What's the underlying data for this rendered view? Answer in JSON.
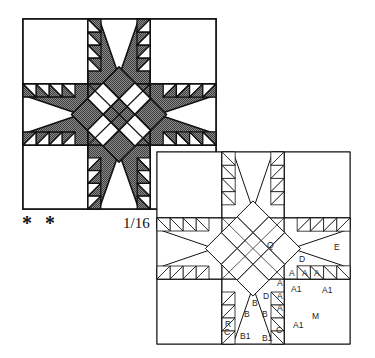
{
  "figure": {
    "rating": "* *",
    "scale_label": "1/16"
  },
  "colors": {
    "background": "#ffffff",
    "line": "#111111",
    "fabric_dark": "#6e6e6e",
    "fabric_light": "#ffffff"
  },
  "colored_block": {
    "name": "Feathered star block (shaded)",
    "grid_x": [
      23,
      88,
      150,
      216
    ],
    "grid_y": [
      19,
      84,
      145,
      209
    ],
    "feathers_per_side": 4
  },
  "pattern_block": {
    "name": "Feathered star block (piece diagram)",
    "grid_x": [
      157,
      222,
      284,
      350
    ],
    "grid_y": [
      152,
      218,
      279,
      344
    ],
    "feathers_per_side": 4,
    "piece_labels": [
      {
        "text": "Q",
        "x": 267,
        "y": 248
      },
      {
        "text": "E",
        "x": 334,
        "y": 250
      },
      {
        "text": "D",
        "x": 299,
        "y": 262
      },
      {
        "text": "A",
        "x": 289,
        "y": 276
      },
      {
        "text": "A",
        "x": 302,
        "y": 276
      },
      {
        "text": "A",
        "x": 314,
        "y": 276
      },
      {
        "text": "A1",
        "x": 291,
        "y": 292
      },
      {
        "text": "A1",
        "x": 322,
        "y": 293
      },
      {
        "text": "D",
        "x": 263,
        "y": 299
      },
      {
        "text": "A",
        "x": 277,
        "y": 286
      },
      {
        "text": "A",
        "x": 277,
        "y": 299
      },
      {
        "text": "A",
        "x": 277,
        "y": 311
      },
      {
        "text": "B",
        "x": 252,
        "y": 306
      },
      {
        "text": "B",
        "x": 244,
        "y": 317
      },
      {
        "text": "B",
        "x": 262,
        "y": 317
      },
      {
        "text": "M",
        "x": 312,
        "y": 319
      },
      {
        "text": "A1",
        "x": 293,
        "y": 328
      },
      {
        "text": "R",
        "x": 225,
        "y": 327
      },
      {
        "text": "C",
        "x": 224,
        "y": 335
      },
      {
        "text": "C",
        "x": 276,
        "y": 333
      },
      {
        "text": "B1",
        "x": 240,
        "y": 339
      },
      {
        "text": "B1",
        "x": 262,
        "y": 341
      }
    ]
  }
}
